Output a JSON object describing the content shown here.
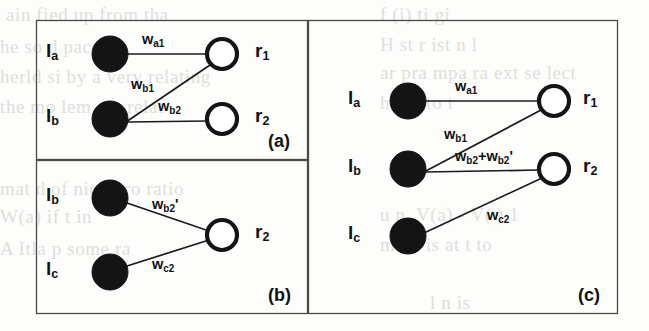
{
  "figure": {
    "width": 649,
    "height": 331,
    "background_color": "#fdfdfc",
    "ink_color": "#141414",
    "frame_color": "#4a4a48"
  },
  "bleed_through_text": [
    {
      "text": "ain fied up from tha",
      "x": 6,
      "y": 4
    },
    {
      "text": "he so d paces",
      "x": 0,
      "y": 36
    },
    {
      "text": "herld si by a very relating",
      "x": 0,
      "y": 66
    },
    {
      "text": "the mo lem are relat",
      "x": 0,
      "y": 96
    },
    {
      "text": "mat d  of  nick  pro ratio",
      "x": 0,
      "y": 178
    },
    {
      "text": "W(a)  if  t in",
      "x": 0,
      "y": 206
    },
    {
      "text": "A  Itla  p  some ra",
      "x": 0,
      "y": 238
    },
    {
      "text": "f  (i)  ti gi",
      "x": 380,
      "y": 4
    },
    {
      "text": "H  st   r  ist n  l",
      "x": 380,
      "y": 34
    },
    {
      "text": "ar  pra   mpa  ra  ext   se lect",
      "x": 380,
      "y": 62
    },
    {
      "text": "h  d  n  to  t",
      "x": 380,
      "y": 92
    },
    {
      "text": "u  n. V(a)  -  V( )  1",
      "x": 380,
      "y": 204
    },
    {
      "text": "manl  is  at  t  to",
      "x": 380,
      "y": 234
    },
    {
      "text": "l  n  is",
      "x": 430,
      "y": 292
    }
  ],
  "panels": [
    {
      "id": "panel-a",
      "tag": "(a)",
      "tag_pos": {
        "x": 268,
        "y": 131
      },
      "frame": {
        "x": 36,
        "y": 20,
        "width": 271,
        "height": 139
      },
      "left_nodes": [
        {
          "name": "l-a",
          "label_html": "l<sub>a</sub>",
          "label_pos": {
            "x": 46,
            "y": 40
          },
          "cx": 110,
          "cy": 54,
          "r": 18,
          "type": "filled"
        },
        {
          "name": "l-b",
          "label_html": "l<sub>b</sub>",
          "label_pos": {
            "x": 46,
            "y": 105
          },
          "cx": 110,
          "cy": 119,
          "r": 18,
          "type": "filled"
        }
      ],
      "right_nodes": [
        {
          "name": "r-1",
          "label_html": "r<sub>1</sub>",
          "label_pos": {
            "x": 255,
            "y": 40
          },
          "cx": 222,
          "cy": 54,
          "r": 15,
          "type": "open"
        },
        {
          "name": "r-2",
          "label_html": "r<sub>2</sub>",
          "label_pos": {
            "x": 255,
            "y": 105
          },
          "cx": 222,
          "cy": 119,
          "r": 15,
          "type": "open"
        }
      ],
      "edges": [
        {
          "name": "edge-la-r1",
          "from": "l-a",
          "to": "r-1",
          "x1": 128,
          "y1": 54,
          "x2": 207,
          "y2": 54,
          "weight_html": "w<sub>a1</sub>",
          "weight_text": "w_a1",
          "weight_pos": {
            "x": 142,
            "y": 31
          }
        },
        {
          "name": "edge-lb-r1",
          "from": "l-b",
          "to": "r-1",
          "x1": 126,
          "y1": 122,
          "x2": 210,
          "y2": 65,
          "weight_html": "w<sub>b1</sub>",
          "weight_text": "w_b1",
          "weight_pos": {
            "x": 131,
            "y": 76
          }
        },
        {
          "name": "edge-lb-r2",
          "from": "l-b",
          "to": "r-2",
          "x1": 128,
          "y1": 122,
          "x2": 207,
          "y2": 121,
          "weight_html": "w<sub>b2</sub>",
          "weight_text": "w_b2",
          "weight_pos": {
            "x": 158,
            "y": 98
          }
        }
      ]
    },
    {
      "id": "panel-b",
      "tag": "(b)",
      "tag_pos": {
        "x": 268,
        "y": 285
      },
      "frame": {
        "x": 36,
        "y": 160,
        "width": 271,
        "height": 153
      },
      "left_nodes": [
        {
          "name": "l-b",
          "label_html": "l<sub>b</sub>",
          "label_pos": {
            "x": 46,
            "y": 184
          },
          "cx": 110,
          "cy": 198,
          "r": 18,
          "type": "filled"
        },
        {
          "name": "l-c",
          "label_html": "l<sub>c</sub>",
          "label_pos": {
            "x": 46,
            "y": 258
          },
          "cx": 110,
          "cy": 272,
          "r": 18,
          "type": "filled"
        }
      ],
      "right_nodes": [
        {
          "name": "r-2",
          "label_html": "r<sub>2</sub>",
          "label_pos": {
            "x": 255,
            "y": 221
          },
          "cx": 222,
          "cy": 235,
          "r": 15,
          "type": "open"
        }
      ],
      "edges": [
        {
          "name": "edge-lb-r2",
          "from": "l-b",
          "to": "r-2",
          "x1": 127,
          "y1": 203,
          "x2": 209,
          "y2": 231,
          "weight_html": "w<sub>b2</sub>'",
          "weight_text": "w_b2'",
          "weight_pos": {
            "x": 152,
            "y": 196
          }
        },
        {
          "name": "edge-lc-r2",
          "from": "l-c",
          "to": "r-2",
          "x1": 127,
          "y1": 266,
          "x2": 209,
          "y2": 240,
          "weight_html": "w<sub>c2</sub>",
          "weight_text": "w_c2",
          "weight_pos": {
            "x": 152,
            "y": 256
          }
        }
      ]
    },
    {
      "id": "panel-c",
      "tag": "(c)",
      "tag_pos": {
        "x": 578,
        "y": 285
      },
      "frame": {
        "x": 308,
        "y": 20,
        "width": 309,
        "height": 293
      },
      "left_nodes": [
        {
          "name": "l-a",
          "label_html": "l<sub>a</sub>",
          "label_pos": {
            "x": 348,
            "y": 87
          },
          "cx": 408,
          "cy": 101,
          "r": 18,
          "type": "filled"
        },
        {
          "name": "l-b",
          "label_html": "l<sub>b</sub>",
          "label_pos": {
            "x": 348,
            "y": 155
          },
          "cx": 408,
          "cy": 169,
          "r": 18,
          "type": "filled"
        },
        {
          "name": "l-c",
          "label_html": "l<sub>c</sub>",
          "label_pos": {
            "x": 348,
            "y": 222
          },
          "cx": 408,
          "cy": 236,
          "r": 18,
          "type": "filled"
        }
      ],
      "right_nodes": [
        {
          "name": "r-1",
          "label_html": "r<sub>1</sub>",
          "label_pos": {
            "x": 583,
            "y": 87
          },
          "cx": 554,
          "cy": 101,
          "r": 15,
          "type": "open"
        },
        {
          "name": "r-2",
          "label_html": "r<sub>2</sub>",
          "label_pos": {
            "x": 583,
            "y": 155
          },
          "cx": 554,
          "cy": 169,
          "r": 15,
          "type": "open"
        }
      ],
      "edges": [
        {
          "name": "edge-la-r1",
          "from": "l-a",
          "to": "r-1",
          "x1": 426,
          "y1": 101,
          "x2": 539,
          "y2": 101,
          "weight_html": "w<sub>a1</sub>",
          "weight_text": "w_a1",
          "weight_pos": {
            "x": 455,
            "y": 78
          }
        },
        {
          "name": "edge-lb-r1",
          "from": "l-b",
          "to": "r-1",
          "x1": 424,
          "y1": 172,
          "x2": 541,
          "y2": 110,
          "weight_html": "w<sub>b1</sub>",
          "weight_text": "w_b1",
          "weight_pos": {
            "x": 444,
            "y": 126
          }
        },
        {
          "name": "edge-lb-r2",
          "from": "l-b",
          "to": "r-2",
          "x1": 426,
          "y1": 172,
          "x2": 539,
          "y2": 170,
          "weight_html": "w<sub>b2</sub>+w<sub>b2</sub>'",
          "weight_text": "w_b2+w_b2'",
          "weight_pos": {
            "x": 455,
            "y": 148
          }
        },
        {
          "name": "edge-lc-r2",
          "from": "l-c",
          "to": "r-2",
          "x1": 424,
          "y1": 233,
          "x2": 542,
          "y2": 178,
          "weight_html": "w<sub>c2</sub>",
          "weight_text": "w_c2",
          "weight_pos": {
            "x": 487,
            "y": 207
          }
        }
      ]
    }
  ]
}
